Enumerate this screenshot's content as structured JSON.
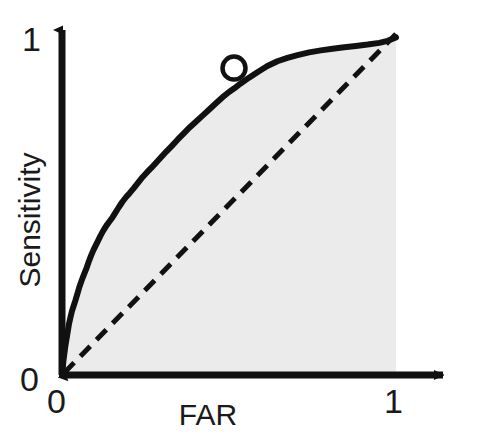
{
  "figure": {
    "background_color": "#ffffff",
    "ink_color": "#111111"
  },
  "axes": {
    "x_title": "FAR",
    "y_title": "Sensitivity",
    "x_ticks": [
      "0",
      "1"
    ],
    "y_ticks": [
      "0",
      "1"
    ],
    "x_tick_zero": "0",
    "x_tick_one": "1",
    "y_tick_zero": "0",
    "y_tick_one": "1"
  },
  "chart_data": {
    "type": "line",
    "title": "",
    "subtitle": "",
    "xlabel": "FAR",
    "ylabel": "Sensitivity",
    "xlim": [
      0,
      1
    ],
    "ylim": [
      0,
      1
    ],
    "xticks": [
      0,
      1
    ],
    "yticks": [
      0,
      1
    ],
    "xticklabels": [
      "0",
      "1"
    ],
    "yticklabels": [
      "0",
      "1"
    ],
    "grid": false,
    "legend": false,
    "legend_position": "none",
    "fill_under_curve": true,
    "fill_color": "#ebebeb",
    "annotations": [
      {
        "name": "operating-point-marker",
        "shape": "circle",
        "x": 0.515,
        "y": 0.9,
        "fill": "#ffffff",
        "stroke": "#111111",
        "label": ""
      }
    ],
    "series": [
      {
        "name": "ROC curve",
        "style": "solid",
        "color": "#111111",
        "linewidth": 6,
        "x": [
          0.0,
          0.004,
          0.01,
          0.016,
          0.021,
          0.026,
          0.03,
          0.034,
          0.04,
          0.046,
          0.052,
          0.058,
          0.063,
          0.068,
          0.074,
          0.08,
          0.087,
          0.094,
          0.1,
          0.107,
          0.115,
          0.124,
          0.133,
          0.142,
          0.151,
          0.16,
          0.17,
          0.181,
          0.192,
          0.203,
          0.215,
          0.228,
          0.241,
          0.254,
          0.268,
          0.283,
          0.298,
          0.313,
          0.329,
          0.346,
          0.364,
          0.382,
          0.4,
          0.42,
          0.44,
          0.46,
          0.48,
          0.5,
          0.515,
          0.535,
          0.56,
          0.585,
          0.615,
          0.645,
          0.675,
          0.705,
          0.74,
          0.775,
          0.81,
          0.845,
          0.88,
          0.915,
          0.95,
          0.975,
          1.0
        ],
        "y": [
          0.0,
          0.04,
          0.085,
          0.12,
          0.15,
          0.172,
          0.188,
          0.2,
          0.218,
          0.238,
          0.258,
          0.275,
          0.288,
          0.3,
          0.315,
          0.332,
          0.35,
          0.366,
          0.378,
          0.392,
          0.408,
          0.424,
          0.438,
          0.45,
          0.462,
          0.476,
          0.492,
          0.508,
          0.522,
          0.534,
          0.548,
          0.564,
          0.58,
          0.594,
          0.608,
          0.624,
          0.64,
          0.656,
          0.672,
          0.69,
          0.708,
          0.726,
          0.742,
          0.76,
          0.778,
          0.796,
          0.814,
          0.83,
          0.84,
          0.855,
          0.872,
          0.888,
          0.906,
          0.92,
          0.93,
          0.938,
          0.946,
          0.952,
          0.957,
          0.961,
          0.965,
          0.969,
          0.974,
          0.98,
          0.99
        ]
      },
      {
        "name": "Chance diagonal",
        "style": "dashed",
        "color": "#111111",
        "linewidth": 5,
        "dash_pattern": "14 9",
        "x": [
          0,
          1
        ],
        "y": [
          0,
          1
        ]
      }
    ]
  }
}
